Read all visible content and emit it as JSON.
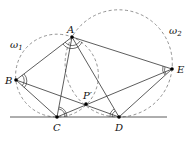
{
  "diagram": {
    "type": "geometry",
    "colors": {
      "line": "#333333",
      "dashed": "#777777",
      "point": "#000000"
    },
    "points": {
      "A": {
        "label": "A",
        "x": 72,
        "y": 37
      },
      "B": {
        "label": "B",
        "x": 16,
        "y": 80
      },
      "C": {
        "label": "C",
        "x": 57,
        "y": 117
      },
      "D": {
        "label": "D",
        "x": 119,
        "y": 117
      },
      "E": {
        "label": "E",
        "x": 172,
        "y": 69
      },
      "P": {
        "label": "P′",
        "x": 86,
        "y": 104
      }
    },
    "circles": [
      {
        "name": "ω1",
        "label_main": "ω",
        "label_sub": "1",
        "cx": 57,
        "cy": 75.6,
        "r": 41.4
      },
      {
        "name": "ω2",
        "label_main": "ω",
        "label_sub": "2",
        "cx": 118.7,
        "cy": 63.4,
        "r": 53.6
      }
    ],
    "segments": [
      [
        "A",
        "B"
      ],
      [
        "A",
        "C"
      ],
      [
        "A",
        "D"
      ],
      [
        "A",
        "E"
      ],
      [
        "B",
        "C"
      ],
      [
        "B",
        "D"
      ],
      [
        "C",
        "E"
      ],
      [
        "D",
        "E"
      ]
    ],
    "baseline": {
      "x1": 10,
      "x2": 167,
      "y": 117
    },
    "angle_marks": [
      "A",
      "B",
      "C",
      "D",
      "E"
    ]
  }
}
